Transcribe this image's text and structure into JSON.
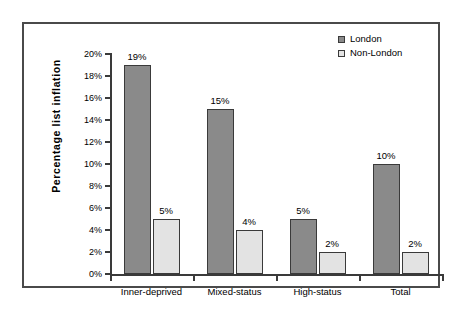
{
  "chart_data": {
    "type": "bar",
    "title": "",
    "xlabel": "",
    "ylabel": "Percentage list inflation",
    "ylim": [
      0,
      20
    ],
    "ytick_step": 2,
    "grid": false,
    "legend_position": "top-right",
    "categories": [
      "Inner-deprived",
      "Mixed-status",
      "High-status",
      "Total"
    ],
    "ytick_labels": [
      "0%",
      "2%",
      "4%",
      "6%",
      "8%",
      "10%",
      "12%",
      "14%",
      "16%",
      "18%",
      "20%"
    ],
    "series": [
      {
        "name": "London",
        "color": "#8a8a8a",
        "values": [
          19,
          15,
          5,
          10
        ],
        "value_labels": [
          "19%",
          "15%",
          "5%",
          "10%"
        ]
      },
      {
        "name": "Non-London",
        "color": "#e3e3e3",
        "values": [
          5,
          4,
          2,
          2
        ],
        "value_labels": [
          "5%",
          "4%",
          "2%",
          "2%"
        ]
      }
    ]
  },
  "legend": {
    "entries": [
      {
        "label": "London"
      },
      {
        "label": "Non-London"
      }
    ]
  },
  "axes": {
    "y_title": "Percentage list inflation"
  },
  "colors": {
    "series_london": "#8a8a8a",
    "series_nonlondon": "#e3e3e3",
    "axis": "#3a3a3a",
    "frame": "#4a4a4a",
    "background": "#ffffff"
  }
}
